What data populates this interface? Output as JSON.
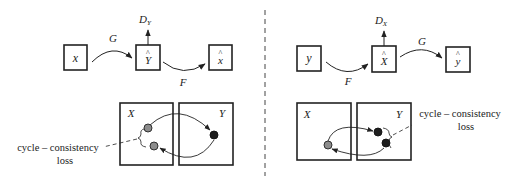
{
  "colors": {
    "stroke": "#222222",
    "gray_node": "#8c8c8c",
    "black_node": "#1e1e1e",
    "background": "#ffffff"
  },
  "left_panel": {
    "nodes": [
      {
        "id": "x",
        "label": "x",
        "hat": false
      },
      {
        "id": "y_hat",
        "label": "Y",
        "hat": true
      },
      {
        "id": "x_hat",
        "label": "x",
        "hat": true
      }
    ],
    "edges": [
      {
        "from": "x",
        "to": "y_hat",
        "label": "G"
      },
      {
        "from": "y_hat",
        "to": "x_hat",
        "label": "F"
      }
    ],
    "discriminator": {
      "label": "D",
      "subscript": "Y"
    },
    "domains": {
      "left": "X",
      "right": "Y"
    },
    "annotation": {
      "line1": "cycle – consistency",
      "line2": "loss"
    }
  },
  "right_panel": {
    "nodes": [
      {
        "id": "y",
        "label": "y",
        "hat": false
      },
      {
        "id": "x_hat",
        "label": "X",
        "hat": true
      },
      {
        "id": "y_hat",
        "label": "y",
        "hat": true
      }
    ],
    "edges": [
      {
        "from": "y",
        "to": "x_hat",
        "label": "F"
      },
      {
        "from": "x_hat",
        "to": "y_hat",
        "label": "G"
      }
    ],
    "discriminator": {
      "label": "D",
      "subscript": "X"
    },
    "domains": {
      "left": "X",
      "right": "Y"
    },
    "annotation": {
      "line1": "cycle – consistency",
      "line2": "loss"
    }
  },
  "hat_glyph": "^"
}
